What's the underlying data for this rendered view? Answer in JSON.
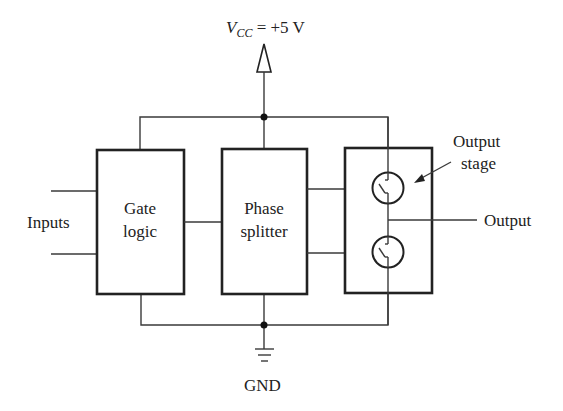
{
  "diagram": {
    "supply_label": {
      "var": "V",
      "sub": "CC",
      "value": " = +5 V"
    },
    "ground_label": "GND",
    "inputs_label": "Inputs",
    "output_label": "Output",
    "output_stage_label": [
      "Output",
      "stage"
    ],
    "blocks": [
      {
        "name": "gate-logic",
        "lines": [
          "Gate",
          "logic"
        ]
      },
      {
        "name": "phase-splitter",
        "lines": [
          "Phase",
          "splitter"
        ]
      },
      {
        "name": "output-stage",
        "lines": []
      }
    ],
    "colors": {
      "line": "#222222",
      "background": "#ffffff"
    }
  }
}
